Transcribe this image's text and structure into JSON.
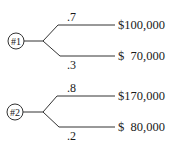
{
  "diagram": {
    "type": "decision-tree",
    "trees": [
      {
        "node_label": "#1",
        "branches": [
          {
            "probability": ".7",
            "payoff": "$100,000"
          },
          {
            "probability": ".3",
            "payoff": "$  70,000"
          }
        ]
      },
      {
        "node_label": "#2",
        "branches": [
          {
            "probability": ".8",
            "payoff": "$170,000"
          },
          {
            "probability": ".2",
            "payoff": "$  80,000"
          }
        ]
      }
    ]
  }
}
